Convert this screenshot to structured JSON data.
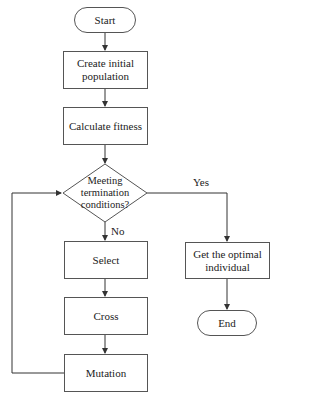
{
  "flowchart": {
    "nodes": {
      "start": "Start",
      "create": "Create initial population",
      "fitness": "Calculate fitness",
      "decision": "Meeting termination conditions?",
      "select": "Select",
      "cross": "Cross",
      "mutation": "Mutation",
      "optimal": "Get the optimal individual",
      "end": "End"
    },
    "edges": {
      "yes": "Yes",
      "no": "No"
    },
    "colors": {
      "line": "#333333",
      "border": "#555555"
    }
  }
}
